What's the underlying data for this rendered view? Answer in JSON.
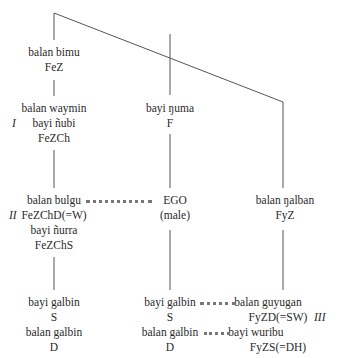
{
  "diagram": {
    "type": "kinship-tree",
    "generation_labels": {
      "I": "I",
      "II": "II",
      "III": "III"
    },
    "left": {
      "gen0": {
        "term": "balan bimu",
        "gloss": "FeZ"
      },
      "gen1": {
        "term1": "balan waymin",
        "term2": "bayi ñubi",
        "gloss": "FeZCh"
      },
      "gen2": {
        "term1": "balan bulgu",
        "gloss1": "FeZChD(=W)",
        "term2": "bayi ñurra",
        "gloss2": "FeZChS"
      },
      "gen3": {
        "term1": "bayi galbin",
        "gloss1": "S",
        "term2": "balan galbin",
        "gloss2": "D"
      }
    },
    "middle": {
      "gen1": {
        "term": "bayi ŋuma",
        "gloss": "F"
      },
      "gen2": {
        "term": "EGO",
        "gloss": "(male)"
      },
      "gen3": {
        "term1": "bayi galbin",
        "gloss1": "S",
        "term2": "balan galbin",
        "gloss2": "D"
      }
    },
    "right": {
      "gen2": {
        "term": "balan ŋalban",
        "gloss": "FyZ"
      },
      "gen3": {
        "term1": "balan guyugan",
        "gloss1": "FyZD(=SW)",
        "term2": "bayi wuribu",
        "gloss2": "FyZS(=DH)"
      }
    },
    "marriage_links": [
      {
        "from": "balan bulgu",
        "to": "EGO"
      },
      {
        "from": "bayi galbin",
        "to": "balan guyugan"
      },
      {
        "from": "balan galbin",
        "to": "bayi wuribu"
      }
    ]
  }
}
